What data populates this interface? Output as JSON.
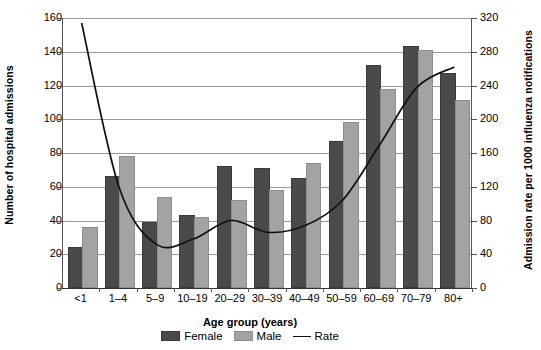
{
  "chart_data": {
    "type": "bar",
    "title": "",
    "xlabel": "Age group (years)",
    "ylabel": "Number of hospital admissions",
    "ylabel_secondary": "Admission rate per 1000 influenza notifications",
    "categories": [
      "<1",
      "1–4",
      "5–9",
      "10–19",
      "20–29",
      "30–39",
      "40–49",
      "50–59",
      "60–69",
      "70–79",
      "80+"
    ],
    "series": [
      {
        "name": "Female",
        "type": "bar",
        "axis": "left",
        "color": "#4a4a4a",
        "values": [
          23,
          65,
          38,
          42,
          71,
          70,
          64,
          86,
          131,
          142,
          126
        ]
      },
      {
        "name": "Male",
        "type": "bar",
        "axis": "left",
        "color": "#a3a3a3",
        "values": [
          35,
          77,
          53,
          41,
          51,
          57,
          73,
          97,
          117,
          140,
          110
        ]
      },
      {
        "name": "Rate",
        "type": "line",
        "axis": "right",
        "color": "#111111",
        "values": [
          314,
          120,
          52,
          58,
          80,
          66,
          74,
          104,
          170,
          238,
          262
        ]
      }
    ],
    "ylim": [
      0,
      160
    ],
    "yticks": [
      0,
      20,
      40,
      60,
      80,
      100,
      120,
      140,
      160
    ],
    "ylim_secondary": [
      0,
      320
    ],
    "yticks_secondary": [
      0,
      40,
      80,
      120,
      160,
      200,
      240,
      280,
      320
    ],
    "grid": true,
    "legend_position": "bottom",
    "legend": [
      "Female",
      "Male",
      "Rate"
    ]
  }
}
